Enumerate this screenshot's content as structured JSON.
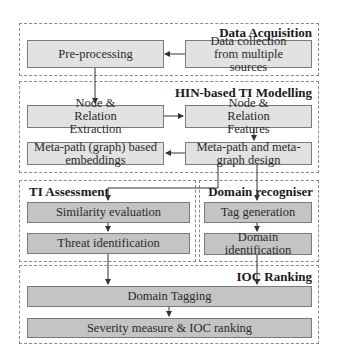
{
  "groups": {
    "data_acquisition": "Data Acquisition",
    "hin_modelling": "HIN-based TI Modelling",
    "ti_assessment": "TI Assessment",
    "domain_recogniser": "Domain recogniser",
    "ioc_ranking": "IOC Ranking"
  },
  "nodes": {
    "preprocessing": "Pre-processing",
    "data_collection": "Data collection from multiple sources",
    "node_relation_extraction": "Node & Relation Extraction",
    "node_relation_features": "Node & Relation Features",
    "metapath_embeddings": "Meta-path (graph) based embeddings",
    "metapath_design": "Meta-path and meta-graph design",
    "similarity_evaluation": "Similarity evaluation",
    "threat_identification": "Threat identification",
    "tag_generation": "Tag generation",
    "domain_identification": "Domain identification",
    "domain_tagging": "Domain Tagging",
    "severity_ranking": "Severity measure & IOC ranking"
  },
  "colors": {
    "light_box": "#e2e2e2",
    "dark_box": "#c4c4c4",
    "border": "#7a7a7a",
    "dashed": "#8a8a8a"
  }
}
